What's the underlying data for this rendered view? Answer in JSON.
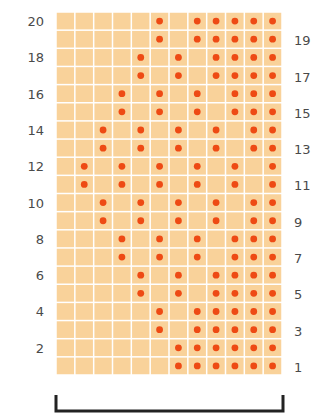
{
  "chart_data": {
    "type": "heatmap",
    "title": "",
    "columns": 12,
    "rows": 20,
    "row_order": "bottom-to-top",
    "left_labels": [
      "2",
      "4",
      "6",
      "8",
      "10",
      "12",
      "14",
      "16",
      "18",
      "20"
    ],
    "right_labels": [
      "1",
      "3",
      "5",
      "7",
      "9",
      "11",
      "13",
      "15",
      "17",
      "19"
    ],
    "filled_cells_by_row": {
      "1": [
        7,
        8,
        9,
        10,
        11,
        12
      ],
      "2": [
        7,
        8,
        9,
        10,
        11,
        12
      ],
      "3": [
        6,
        8,
        9,
        10,
        11,
        12
      ],
      "4": [
        6,
        8,
        9,
        10,
        11,
        12
      ],
      "5": [
        5,
        7,
        9,
        10,
        11,
        12
      ],
      "6": [
        5,
        7,
        9,
        10,
        11,
        12
      ],
      "7": [
        4,
        6,
        8,
        10,
        11,
        12
      ],
      "8": [
        4,
        6,
        8,
        10,
        11,
        12
      ],
      "9": [
        3,
        5,
        7,
        9,
        11,
        12
      ],
      "10": [
        3,
        5,
        7,
        9,
        11,
        12
      ],
      "11": [
        2,
        4,
        6,
        8,
        10,
        12
      ],
      "12": [
        2,
        4,
        6,
        8,
        10,
        12
      ],
      "13": [
        3,
        5,
        7,
        9,
        11,
        12
      ],
      "14": [
        3,
        5,
        7,
        9,
        11,
        12
      ],
      "15": [
        4,
        6,
        8,
        10,
        11,
        12
      ],
      "16": [
        4,
        6,
        8,
        10,
        11,
        12
      ],
      "17": [
        5,
        7,
        9,
        10,
        11,
        12
      ],
      "18": [
        5,
        7,
        9,
        10,
        11,
        12
      ],
      "19": [
        6,
        8,
        9,
        10,
        11,
        12
      ],
      "20": [
        6,
        8,
        9,
        10,
        11,
        12
      ]
    },
    "colors": {
      "cell": "#f9d29a",
      "dot": "#ee4a14",
      "grid": "#ffffff"
    },
    "bracket_below": true
  }
}
